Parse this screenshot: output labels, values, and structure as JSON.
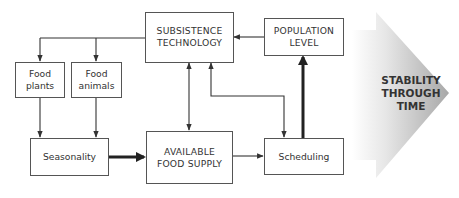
{
  "diagram": {
    "nodes": {
      "subsistence_technology": {
        "lines": [
          "SUBSISTENCE",
          "TECHNOLOGY"
        ]
      },
      "population_level": {
        "lines": [
          "POPULATION",
          "LEVEL"
        ]
      },
      "food_plants": {
        "lines": [
          "Food",
          "plants"
        ]
      },
      "food_animals": {
        "lines": [
          "Food",
          "animals"
        ]
      },
      "seasonality": {
        "lines": [
          "Seasonality"
        ]
      },
      "available_food_supply": {
        "lines": [
          "AVAILABLE",
          "FOOD SUPPLY"
        ]
      },
      "scheduling": {
        "lines": [
          "Scheduling"
        ]
      }
    },
    "edges": [
      {
        "from": "subsistence_technology",
        "to": "food_plants",
        "weight": "thin"
      },
      {
        "from": "subsistence_technology",
        "to": "food_animals",
        "weight": "thin"
      },
      {
        "from": "food_plants",
        "to": "seasonality",
        "weight": "thin"
      },
      {
        "from": "food_animals",
        "to": "seasonality",
        "weight": "thin"
      },
      {
        "from": "seasonality",
        "to": "available_food_supply",
        "weight": "thick"
      },
      {
        "from": "subsistence_technology",
        "to": "available_food_supply",
        "weight": "thin",
        "bidirectional": true
      },
      {
        "from": "scheduling",
        "to": "subsistence_technology",
        "weight": "thin",
        "bidirectional": true
      },
      {
        "from": "available_food_supply",
        "to": "scheduling",
        "weight": "thin"
      },
      {
        "from": "scheduling",
        "to": "population_level",
        "weight": "thick"
      },
      {
        "from": "population_level",
        "to": "subsistence_technology",
        "weight": "thin"
      }
    ],
    "outcome": {
      "lines": [
        "STABILITY",
        "THROUGH",
        "TIME"
      ],
      "gradient_start": "#ffffff",
      "gradient_end": "#a8a8a8"
    }
  }
}
